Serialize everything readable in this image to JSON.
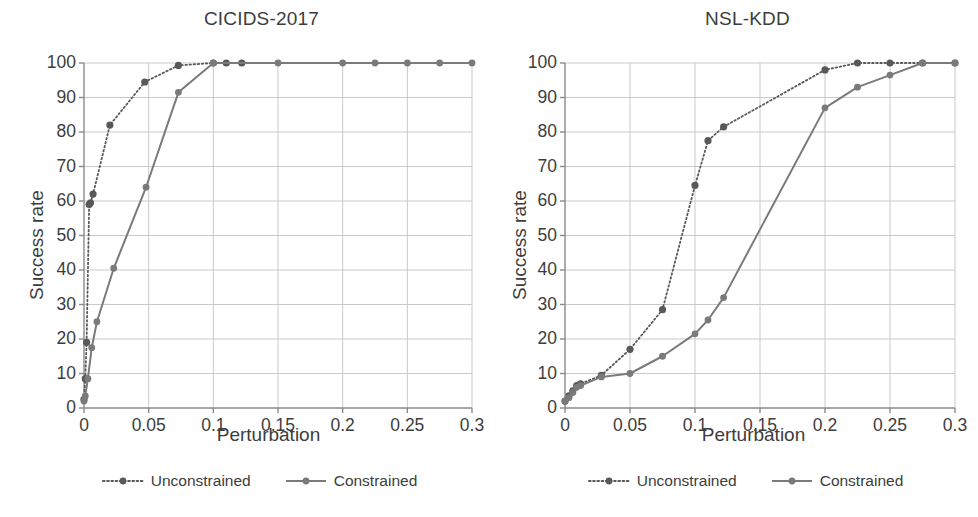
{
  "figure": {
    "axis_label_x": "Perturbation",
    "axis_label_y": "Success rate"
  },
  "legend": {
    "unconstrained_label": "Unconstrained",
    "constrained_label": "Constrained",
    "unconstrained_style": "dotted-line-with-round-marker",
    "constrained_style": "solid-line-with-round-marker"
  },
  "colors": {
    "unconstrained": "#595959",
    "constrained": "#7a7a7a",
    "grid": "#c9c9c9",
    "axis": "#8a8a8a",
    "text": "#3d3d3d",
    "background": "#ffffff"
  },
  "y_ticks": [
    "0",
    "10",
    "20",
    "30",
    "40",
    "50",
    "60",
    "70",
    "80",
    "90",
    "100"
  ],
  "x_ticks": [
    "0",
    "0.05",
    "0.1",
    "0.15",
    "0.2",
    "0.25",
    "0.3"
  ],
  "chart_data": [
    {
      "type": "line",
      "title": "CICIDS-2017",
      "xlabel": "Perturbation",
      "ylabel": "Success rate",
      "xlim": [
        0,
        0.3
      ],
      "ylim": [
        0,
        100
      ],
      "xticks": [
        0,
        0.05,
        0.1,
        0.15,
        0.2,
        0.25,
        0.3
      ],
      "yticks": [
        0,
        10,
        20,
        30,
        40,
        50,
        60,
        70,
        80,
        90,
        100
      ],
      "grid": true,
      "legend_position": "below",
      "series": [
        {
          "name": "Unconstrained",
          "style": "dotted",
          "marker": "circle",
          "points": [
            [
              0.0,
              2.5
            ],
            [
              0.001,
              8.5
            ],
            [
              0.002,
              19.0
            ],
            [
              0.004,
              59.0
            ],
            [
              0.005,
              59.5
            ],
            [
              0.007,
              62.0
            ],
            [
              0.02,
              82.0
            ],
            [
              0.047,
              94.5
            ],
            [
              0.073,
              99.3
            ],
            [
              0.1,
              100.0
            ],
            [
              0.11,
              100.0
            ],
            [
              0.122,
              100.0
            ]
          ]
        },
        {
          "name": "Constrained",
          "style": "solid",
          "marker": "circle",
          "points": [
            [
              0.0,
              2.0
            ],
            [
              0.001,
              3.5
            ],
            [
              0.003,
              8.5
            ],
            [
              0.006,
              17.5
            ],
            [
              0.01,
              25.0
            ],
            [
              0.023,
              40.5
            ],
            [
              0.048,
              64.0
            ],
            [
              0.073,
              91.5
            ],
            [
              0.1,
              100.0
            ],
            [
              0.15,
              100.0
            ],
            [
              0.2,
              100.0
            ],
            [
              0.225,
              100.0
            ],
            [
              0.25,
              100.0
            ],
            [
              0.275,
              100.0
            ],
            [
              0.3,
              100.0
            ]
          ]
        }
      ]
    },
    {
      "type": "line",
      "title": "NSL-KDD",
      "xlabel": "Perturbation",
      "ylabel": "Success rate",
      "xlim": [
        0,
        0.3
      ],
      "ylim": [
        0,
        100
      ],
      "xticks": [
        0,
        0.05,
        0.1,
        0.15,
        0.2,
        0.25,
        0.3
      ],
      "yticks": [
        0,
        10,
        20,
        30,
        40,
        50,
        60,
        70,
        80,
        90,
        100
      ],
      "grid": true,
      "legend_position": "below",
      "series": [
        {
          "name": "Unconstrained",
          "style": "dotted",
          "marker": "circle",
          "points": [
            [
              0.0,
              2.0
            ],
            [
              0.003,
              3.5
            ],
            [
              0.006,
              5.0
            ],
            [
              0.009,
              6.5
            ],
            [
              0.012,
              7.0
            ],
            [
              0.028,
              9.5
            ],
            [
              0.05,
              17.0
            ],
            [
              0.075,
              28.5
            ],
            [
              0.1,
              64.5
            ],
            [
              0.11,
              77.5
            ],
            [
              0.122,
              81.5
            ],
            [
              0.2,
              98.0
            ],
            [
              0.225,
              100.0
            ],
            [
              0.25,
              100.0
            ],
            [
              0.275,
              100.0
            ],
            [
              0.3,
              100.0
            ]
          ]
        },
        {
          "name": "Constrained",
          "style": "solid",
          "marker": "circle",
          "points": [
            [
              0.0,
              2.0
            ],
            [
              0.003,
              3.0
            ],
            [
              0.006,
              4.5
            ],
            [
              0.009,
              6.0
            ],
            [
              0.012,
              6.5
            ],
            [
              0.028,
              9.0
            ],
            [
              0.05,
              10.0
            ],
            [
              0.075,
              15.0
            ],
            [
              0.1,
              21.5
            ],
            [
              0.11,
              25.5
            ],
            [
              0.122,
              32.0
            ],
            [
              0.2,
              87.0
            ],
            [
              0.225,
              93.0
            ],
            [
              0.25,
              96.5
            ],
            [
              0.275,
              100.0
            ],
            [
              0.3,
              100.0
            ]
          ]
        }
      ]
    }
  ]
}
